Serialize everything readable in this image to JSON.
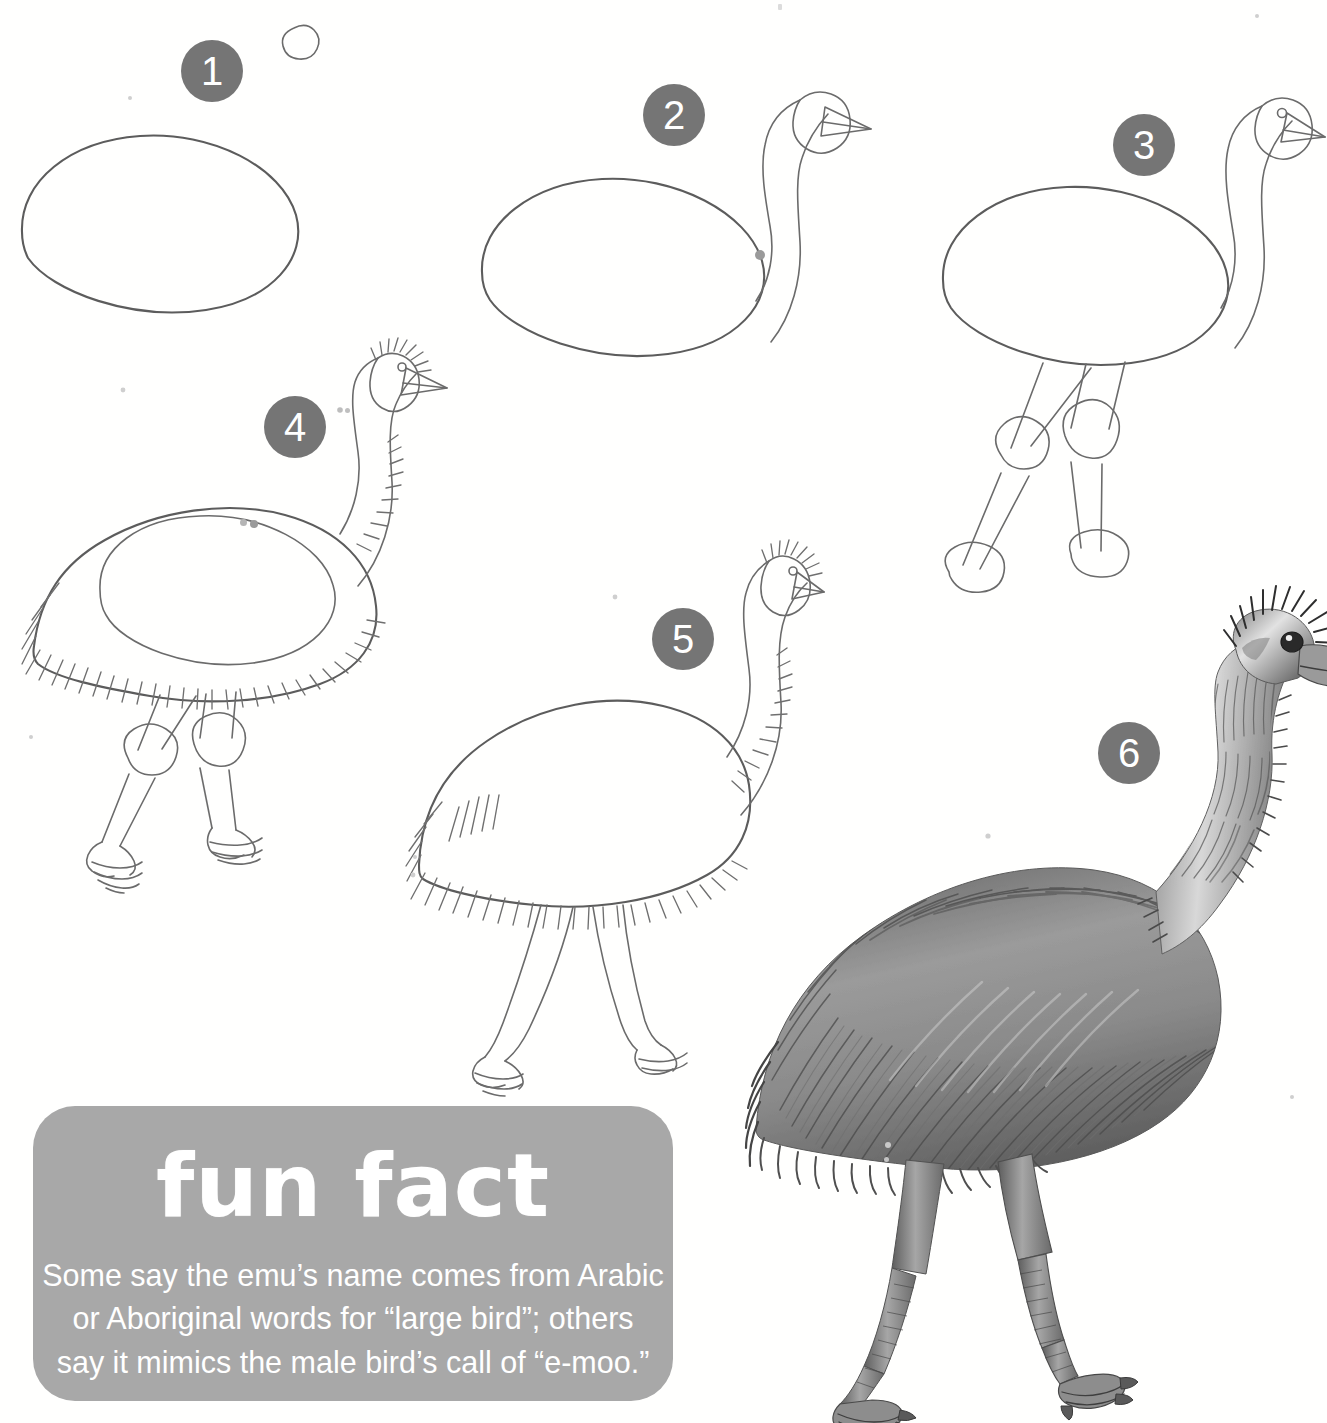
{
  "page": {
    "subject": "emu",
    "background_color": "#fffffe",
    "ink_color": "#5c5c5c",
    "badge_color": "#757575",
    "badge_text_color": "#ffffff",
    "funfact_box_color": "#a8a8a8"
  },
  "steps": [
    {
      "number": "1",
      "badge_x": 181,
      "badge_y": 40,
      "badge_size": 62,
      "description": "Draw a large egg-shaped oval for the body and a small circle for the head."
    },
    {
      "number": "2",
      "badge_x": 643,
      "badge_y": 84,
      "badge_size": 62,
      "description": "Connect the head to the body with a long curved S-shaped neck and add a triangular beak."
    },
    {
      "number": "3",
      "badge_x": 1113,
      "badge_y": 114,
      "badge_size": 62,
      "description": "Add two stick legs with oval knee joints and oval feet."
    },
    {
      "number": "4",
      "badge_x": 264,
      "badge_y": 396,
      "badge_size": 62,
      "description": "Draw the shaggy feathered outline around the body and add toes with claws."
    },
    {
      "number": "5",
      "badge_x": 652,
      "badge_y": 608,
      "badge_size": 62,
      "description": "Erase the guide shapes, leaving the clean feathered outline of the emu."
    },
    {
      "number": "6",
      "badge_x": 1098,
      "badge_y": 722,
      "badge_size": 62,
      "description": "Shade the emu with long directional strokes to create the shaggy feather texture."
    }
  ],
  "funfact": {
    "title": "fun fact",
    "box": {
      "x": 33,
      "y": 1106,
      "width": 640,
      "height": 295
    },
    "lines": [
      "Some say the emu’s name comes from Arabic",
      "or Aboriginal words for “large bird”; others",
      "say it mimics the male bird’s call of “e-moo.”"
    ],
    "full_text": "Some say the emu’s name comes from Arabic or Aboriginal words for “large bird”; others say it mimics the male bird’s call of “e-moo.”"
  }
}
